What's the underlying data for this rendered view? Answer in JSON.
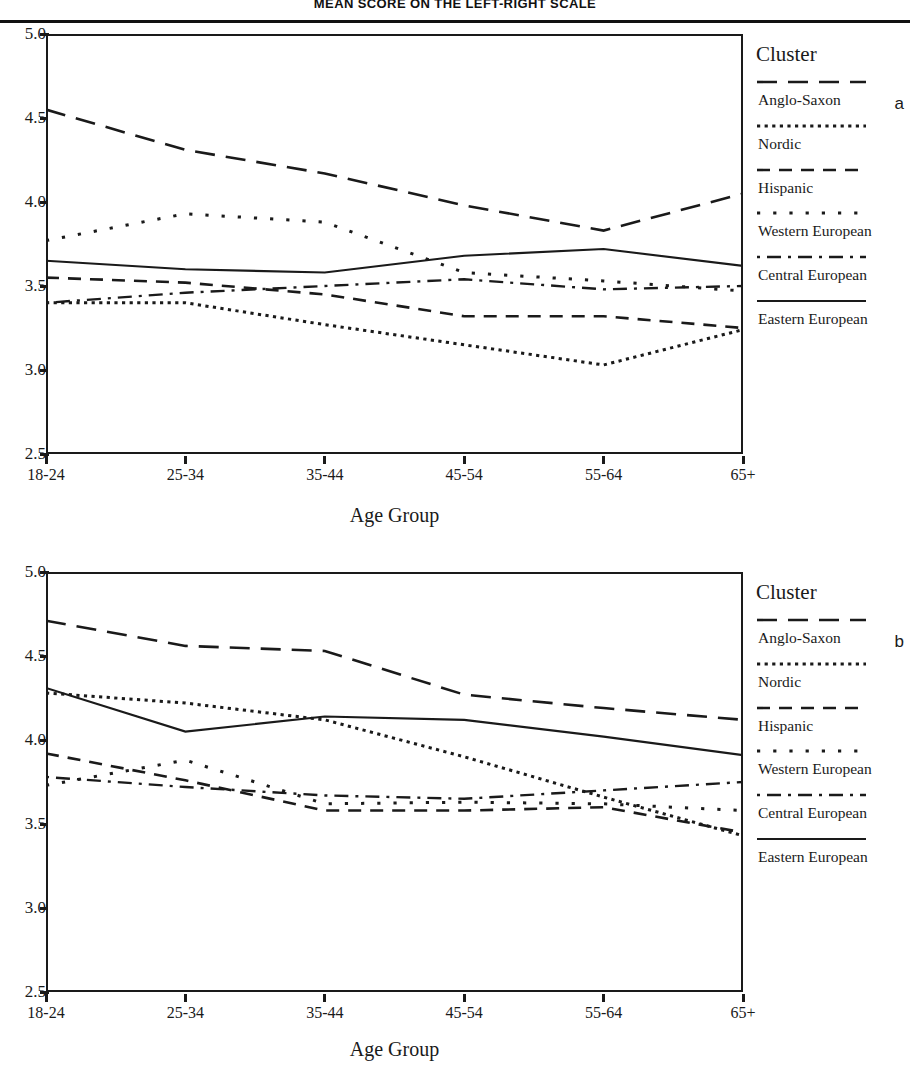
{
  "title": "MEAN SCORE ON THE LEFT-RIGHT SCALE",
  "axis": {
    "x_title": "Age Group",
    "y_ticks": [
      "5.0",
      "4.5",
      "4.0",
      "3.5",
      "3.0",
      "2.5"
    ],
    "x_ticks": [
      "18-24",
      "25-34",
      "35-44",
      "45-54",
      "55-64",
      "65+"
    ]
  },
  "legend": {
    "title": "Cluster",
    "entries": [
      {
        "label": "Anglo-Saxon",
        "style": "long-dash",
        "icon": "long-dash-line-icon"
      },
      {
        "label": "Nordic",
        "style": "fine-dot",
        "icon": "fine-dotted-line-icon"
      },
      {
        "label": "Hispanic",
        "style": "medium-dash",
        "icon": "medium-dash-line-icon"
      },
      {
        "label": "Western European",
        "style": "sparse-dot",
        "icon": "sparse-dotted-line-icon"
      },
      {
        "label": "Central European",
        "style": "dash-dot",
        "icon": "dash-dot-line-icon"
      },
      {
        "label": "Eastern European",
        "style": "solid",
        "icon": "solid-line-icon"
      }
    ]
  },
  "panels": [
    {
      "letter": "a"
    },
    {
      "letter": "b"
    }
  ],
  "chart_data": [
    {
      "type": "line",
      "panel": "a",
      "title": "MEAN SCORE ON THE LEFT-RIGHT SCALE",
      "xlabel": "Age Group",
      "ylabel": "",
      "categories": [
        "18-24",
        "25-34",
        "35-44",
        "45-54",
        "55-64",
        "65+"
      ],
      "ylim": [
        2.5,
        5.0
      ],
      "yticks": [
        2.5,
        3.0,
        3.5,
        4.0,
        4.5,
        5.0
      ],
      "grid": false,
      "legend_position": "right",
      "series": [
        {
          "name": "Anglo-Saxon",
          "style": "long-dash",
          "values": [
            4.55,
            4.31,
            4.17,
            3.98,
            3.83,
            4.05
          ]
        },
        {
          "name": "Nordic",
          "style": "fine-dot",
          "values": [
            3.4,
            3.4,
            3.27,
            3.15,
            3.03,
            3.24
          ]
        },
        {
          "name": "Hispanic",
          "style": "medium-dash",
          "values": [
            3.55,
            3.52,
            3.45,
            3.32,
            3.32,
            3.25
          ]
        },
        {
          "name": "Western European",
          "style": "sparse-dot",
          "values": [
            3.77,
            3.93,
            3.88,
            3.58,
            3.53,
            3.47
          ]
        },
        {
          "name": "Central European",
          "style": "dash-dot",
          "values": [
            3.4,
            3.46,
            3.5,
            3.54,
            3.48,
            3.5
          ]
        },
        {
          "name": "Eastern European",
          "style": "solid",
          "values": [
            3.65,
            3.6,
            3.58,
            3.68,
            3.72,
            3.62
          ]
        }
      ]
    },
    {
      "type": "line",
      "panel": "b",
      "title": "",
      "xlabel": "Age Group",
      "ylabel": "",
      "categories": [
        "18-24",
        "25-34",
        "35-44",
        "45-54",
        "55-64",
        "65+"
      ],
      "ylim": [
        2.5,
        5.0
      ],
      "yticks": [
        2.5,
        3.0,
        3.5,
        4.0,
        4.5,
        5.0
      ],
      "grid": false,
      "legend_position": "right",
      "series": [
        {
          "name": "Anglo-Saxon",
          "style": "long-dash",
          "values": [
            4.71,
            4.56,
            4.53,
            4.27,
            4.19,
            4.12
          ]
        },
        {
          "name": "Nordic",
          "style": "fine-dot",
          "values": [
            4.28,
            4.22,
            4.12,
            3.9,
            3.66,
            3.43
          ]
        },
        {
          "name": "Hispanic",
          "style": "medium-dash",
          "values": [
            3.92,
            3.76,
            3.58,
            3.58,
            3.6,
            3.45
          ]
        },
        {
          "name": "Western European",
          "style": "sparse-dot",
          "values": [
            3.73,
            3.88,
            3.62,
            3.63,
            3.62,
            3.58
          ]
        },
        {
          "name": "Central European",
          "style": "dash-dot",
          "values": [
            3.78,
            3.72,
            3.67,
            3.65,
            3.7,
            3.75
          ]
        },
        {
          "name": "Eastern European",
          "style": "solid",
          "values": [
            4.31,
            4.05,
            4.14,
            4.12,
            4.02,
            3.91
          ]
        }
      ]
    }
  ]
}
